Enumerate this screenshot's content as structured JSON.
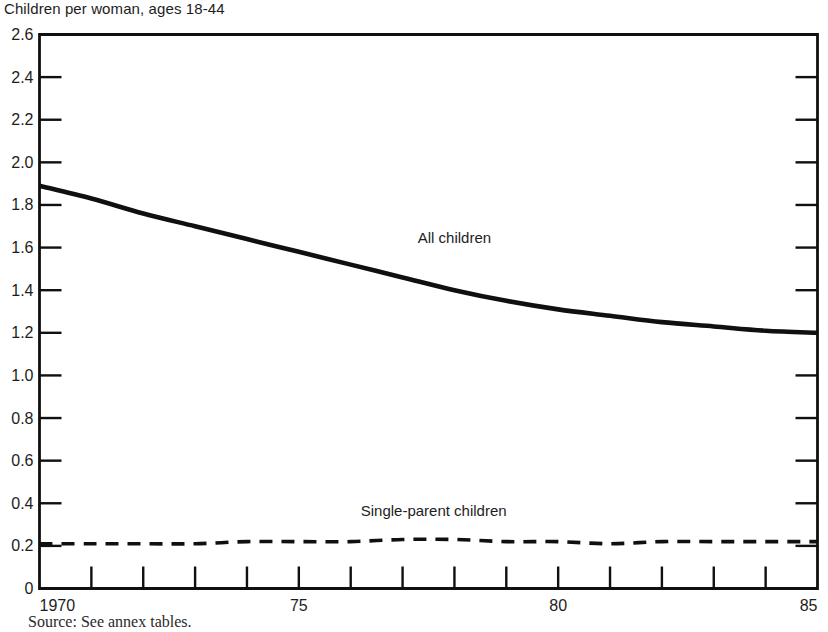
{
  "chart_data": {
    "type": "line",
    "title": "Children per woman, ages 18-44",
    "xlabel": "",
    "ylabel": "",
    "source": "Source: See annex tables.",
    "grid": false,
    "legend_position": "inline-annotation",
    "xlim": [
      1970,
      1985
    ],
    "ylim": [
      0,
      2.6
    ],
    "y_ticks": [
      0,
      0.2,
      0.4,
      0.6,
      0.8,
      1.0,
      1.2,
      1.4,
      1.6,
      1.8,
      2.0,
      2.2,
      2.4,
      2.6
    ],
    "y_tick_labels": [
      "0",
      "0.2",
      "0.4",
      "0.6",
      "0.8",
      "1.0",
      "1.2",
      "1.4",
      "1.6",
      "1.8",
      "2.0",
      "2.2",
      "2.4",
      "2.6"
    ],
    "x_ticks": [
      1970,
      1971,
      1972,
      1973,
      1974,
      1975,
      1976,
      1977,
      1978,
      1979,
      1980,
      1981,
      1982,
      1983,
      1984,
      1985
    ],
    "x_tick_labels_shown": [
      "1970",
      "75",
      "80",
      "85"
    ],
    "x_tick_label_positions": [
      1970,
      1975,
      1980,
      1985
    ],
    "x": [
      1970,
      1971,
      1972,
      1973,
      1974,
      1975,
      1976,
      1977,
      1978,
      1979,
      1980,
      1981,
      1982,
      1983,
      1984,
      1985
    ],
    "series": [
      {
        "name": "All children",
        "style": "solid",
        "label_x": 1978.0,
        "label_y": 1.62,
        "values": [
          1.89,
          1.83,
          1.76,
          1.7,
          1.64,
          1.58,
          1.52,
          1.46,
          1.4,
          1.35,
          1.31,
          1.28,
          1.25,
          1.23,
          1.21,
          1.2
        ]
      },
      {
        "name": "Single-parent children",
        "style": "dashed",
        "label_x": 1977.6,
        "label_y": 0.34,
        "values": [
          0.21,
          0.21,
          0.21,
          0.21,
          0.22,
          0.22,
          0.22,
          0.23,
          0.23,
          0.22,
          0.22,
          0.21,
          0.22,
          0.22,
          0.22,
          0.22
        ]
      }
    ],
    "colors": {
      "line": "#101010",
      "axis": "#101010",
      "text": "#1d1d1d",
      "background": "#ffffff"
    }
  }
}
